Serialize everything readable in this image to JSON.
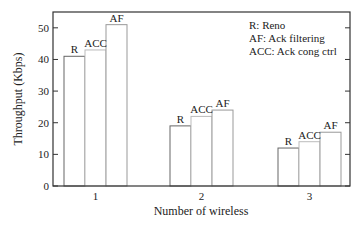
{
  "chart_data": {
    "type": "bar",
    "title": "",
    "xlabel": "Number of wireless",
    "ylabel": "Throughput (Kbps)",
    "ylim": [
      0,
      55
    ],
    "yticks": [
      0,
      10,
      20,
      30,
      40,
      50
    ],
    "categories": [
      "1",
      "2",
      "3"
    ],
    "grid": false,
    "legend_position": "upper right (text only)",
    "series": [
      {
        "name": "R",
        "values": [
          41,
          19,
          12
        ]
      },
      {
        "name": "ACC",
        "values": [
          43,
          22,
          14
        ]
      },
      {
        "name": "AF",
        "values": [
          51,
          24,
          17
        ]
      }
    ],
    "bar_labels": [
      "R",
      "ACC",
      "AF"
    ],
    "legend": [
      "R: Reno",
      "AF: Ack filtering",
      "ACC: Ack cong ctrl"
    ]
  },
  "colors": {
    "axis": "#333333",
    "bar_r": "#666666",
    "bar_acc": "#bbbbbb",
    "bar_af": "#999999",
    "text": "#222222"
  }
}
